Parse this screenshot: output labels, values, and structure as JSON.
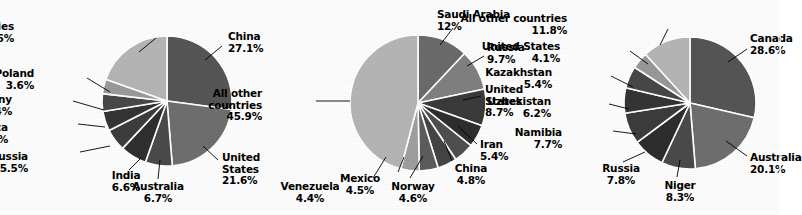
{
  "figure": {
    "background_color": "#fdfdfd",
    "text_color": "#000000",
    "leader_line_color": "#000000",
    "slice_separator_color": "#ffffff"
  },
  "chart_data": [
    {
      "type": "pie",
      "title": "",
      "index": 0,
      "center": [
        167,
        101
      ],
      "radius": 65,
      "start_angle_deg": 0,
      "direction": "clockwise",
      "categories": [
        "China",
        "United States",
        "Australia",
        "India",
        "Russia",
        "South Africa",
        "Germany",
        "Poland",
        "All other countries"
      ],
      "values": [
        27.1,
        21.6,
        6.7,
        6.6,
        5.5,
        4.9,
        4.4,
        3.6,
        19.6
      ],
      "value_labels": [
        "27.1%",
        "21.6%",
        "6.7%",
        "6.6%",
        "5.5%",
        "4.9%",
        "4.4%",
        "3.6%",
        "19.6%"
      ],
      "colors": [
        "#555555",
        "#6e6e6e",
        "#4a4a4a",
        "#2f2f2f",
        "#3d3d3d",
        "#343434",
        "#484848",
        "#9a9a9a",
        "#b5b5b5"
      ],
      "labels": [
        {
          "name": "China",
          "pct": "27.1%",
          "x": 228,
          "y": 31,
          "align": "l",
          "line": [
            [
              222,
              46
            ],
            [
              205,
              60
            ]
          ]
        },
        {
          "name": "United States",
          "pct": "21.6%",
          "x": 222,
          "y": 152,
          "align": "l",
          "lines": [
            "United",
            "States",
            "21.6%"
          ],
          "line": [
            [
              218,
              160
            ],
            [
              203,
              146
            ]
          ]
        },
        {
          "name": "Australia",
          "pct": "6.7%",
          "x": 128,
          "y": 181,
          "align": "c",
          "line": [
            [
              158,
              179
            ],
            [
              160,
              160
            ]
          ]
        },
        {
          "name": "India",
          "pct": "6.6%",
          "x": 96,
          "y": 170,
          "align": "c",
          "line": [
            [
              129,
              170
            ],
            [
              141,
              158
            ]
          ]
        },
        {
          "name": "Russia",
          "pct": "5.5%",
          "x": 28,
          "y": 151,
          "align": "r",
          "line": [
            [
              80,
              152
            ],
            [
              110,
              146
            ]
          ]
        },
        {
          "name": "South Africa",
          "pct": "4.9%",
          "x": 8,
          "y": 122,
          "align": "r",
          "line": [
            [
              78,
              124
            ],
            [
              105,
              127
            ]
          ]
        },
        {
          "name": "Germany",
          "pct": "4.4%",
          "x": 12,
          "y": 94,
          "align": "r",
          "line": [
            [
              73,
              101
            ],
            [
              104,
              110
            ]
          ]
        },
        {
          "name": "Poland",
          "pct": "3.6%",
          "x": 34,
          "y": 68,
          "align": "r",
          "line": [
            [
              87,
              78
            ],
            [
              110,
              92
            ]
          ]
        },
        {
          "name": "All other countries",
          "pct": "19.6%",
          "x": 14,
          "y": 21,
          "align": "r",
          "line": [
            [
              156,
              38
            ],
            [
              139,
              52
            ]
          ]
        }
      ]
    },
    {
      "type": "pie",
      "title": "",
      "index": 1,
      "center": [
        418,
        103
      ],
      "radius": 68,
      "start_angle_deg": 0,
      "direction": "clockwise",
      "categories": [
        "Saudi Arabia",
        "Russia",
        "United States",
        "Iran",
        "China",
        "Norway",
        "Mexico",
        "Venezuela",
        "All other countries"
      ],
      "values": [
        12.0,
        9.7,
        8.7,
        5.4,
        4.8,
        4.6,
        4.5,
        4.4,
        45.9
      ],
      "value_labels": [
        "12%",
        "9.7%",
        "8.7%",
        "5.4%",
        "4.8%",
        "4.6%",
        "4.5%",
        "4.4%",
        "45.9%"
      ],
      "colors": [
        "#6a6a6a",
        "#808080",
        "#3a3a3a",
        "#2e2e2e",
        "#4f4f4f",
        "#444444",
        "#5c5c5c",
        "#9f9f9f",
        "#b5b5b5"
      ],
      "labels": [
        {
          "name": "Saudi Arabia",
          "pct": "12%",
          "x": 437,
          "y": 9,
          "align": "l",
          "line": [
            [
              453,
              28
            ],
            [
              440,
              45
            ]
          ]
        },
        {
          "name": "Russia",
          "pct": "9.7%",
          "x": 487,
          "y": 42,
          "align": "l",
          "line": [
            [
              484,
              56
            ],
            [
              467,
              66
            ]
          ]
        },
        {
          "name": "United States",
          "pct": "8.7%",
          "x": 485,
          "y": 84,
          "align": "l",
          "lines": [
            "United",
            "States",
            "8.7%"
          ],
          "line": [
            [
              481,
              96
            ],
            [
              463,
              100
            ]
          ]
        },
        {
          "name": "Iran",
          "pct": "5.4%",
          "x": 480,
          "y": 139,
          "align": "l",
          "line": [
            [
              477,
              144
            ],
            [
              458,
              126
            ]
          ]
        },
        {
          "name": "China",
          "pct": "4.8%",
          "x": 441,
          "y": 163,
          "align": "c",
          "line": [
            [
              452,
              161
            ],
            [
              444,
              141
            ]
          ]
        },
        {
          "name": "Norway",
          "pct": "4.6%",
          "x": 383,
          "y": 181,
          "align": "c",
          "line": [
            [
              410,
              178
            ],
            [
              423,
              156
            ]
          ]
        },
        {
          "name": "Mexico",
          "pct": "4.5%",
          "x": 330,
          "y": 173,
          "align": "c",
          "line": [
            [
              398,
              172
            ],
            [
              404,
              157
            ]
          ]
        },
        {
          "name": "Venezuela",
          "pct": "4.4%",
          "x": 280,
          "y": 181,
          "align": "c",
          "line": [
            [
              373,
              178
            ],
            [
              386,
              157
            ]
          ]
        },
        {
          "name": "All other countries",
          "pct": "45.9%",
          "x": 262,
          "y": 88,
          "align": "r",
          "lines": [
            "All other",
            "countries",
            "45.9%"
          ],
          "line": [
            [
              316,
              101
            ],
            [
              350,
              101
            ]
          ]
        }
      ]
    },
    {
      "type": "pie",
      "title": "",
      "index": 2,
      "center": [
        690,
        103
      ],
      "radius": 66,
      "start_angle_deg": 0,
      "direction": "clockwise",
      "categories": [
        "Canada",
        "Australia",
        "Niger",
        "Russia",
        "Namibia",
        "Uzbekistan",
        "Kazakhstan",
        "United States",
        "All other countries"
      ],
      "values": [
        28.6,
        20.1,
        8.3,
        7.8,
        7.7,
        6.2,
        5.4,
        4.1,
        11.8
      ],
      "value_labels": [
        "28.6%",
        "20.1%",
        "8.3%",
        "7.8%",
        "7.7%",
        "6.2%",
        "5.4%",
        "4.1%",
        "11.8%"
      ],
      "colors": [
        "#555555",
        "#6e6e6e",
        "#4a4a4a",
        "#2d2d2d",
        "#3c3c3c",
        "#343434",
        "#474747",
        "#989898",
        "#b5b5b5"
      ],
      "labels": [
        {
          "name": "Canada",
          "pct": "28.6%",
          "x": 750,
          "y": 33,
          "align": "l",
          "truncated": true,
          "line": [
            [
              747,
              49
            ],
            [
              728,
              62
            ]
          ]
        },
        {
          "name": "Australia",
          "pct": "20.1%",
          "x": 750,
          "y": 152,
          "align": "l",
          "truncated": true,
          "line": [
            [
              747,
              156
            ],
            [
              726,
              141
            ]
          ]
        },
        {
          "name": "Niger",
          "pct": "8.3%",
          "x": 650,
          "y": 180,
          "align": "c",
          "line": [
            [
              677,
              177
            ],
            [
              680,
              160
            ]
          ]
        },
        {
          "name": "Russia",
          "pct": "7.8%",
          "x": 591,
          "y": 163,
          "align": "c",
          "line": [
            [
              623,
              162
            ],
            [
              645,
              152
            ]
          ]
        },
        {
          "name": "Namibia",
          "pct": "7.7%",
          "x": 562,
          "y": 127,
          "align": "r",
          "line": [
            [
              613,
              131
            ],
            [
              636,
              134
            ]
          ]
        },
        {
          "name": "Uzbekistan",
          "pct": "6.2%",
          "x": 551,
          "y": 96,
          "align": "r",
          "line": [
            [
              609,
              104
            ],
            [
              629,
              109
            ]
          ]
        },
        {
          "name": "Kazakhstan",
          "pct": "5.4%",
          "x": 552,
          "y": 67,
          "align": "r",
          "line": [
            [
              611,
              76
            ],
            [
              633,
              87
            ]
          ]
        },
        {
          "name": "United States",
          "pct": "4.1%",
          "x": 560,
          "y": 41,
          "align": "r",
          "line": [
            [
              630,
              51
            ],
            [
              648,
              64
            ]
          ]
        },
        {
          "name": "All other countries",
          "pct": "11.8%",
          "x": 567,
          "y": 13,
          "align": "r",
          "line": [
            [
              668,
              29
            ],
            [
              660,
              45
            ]
          ]
        }
      ]
    }
  ]
}
